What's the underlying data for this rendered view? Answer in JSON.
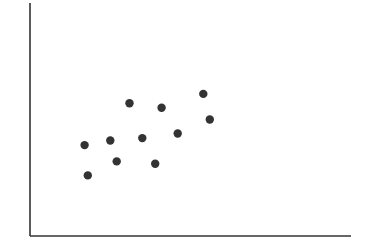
{
  "chart_data": {
    "type": "scatter",
    "title": "",
    "xlabel": "",
    "ylabel": "",
    "xlim": [
      0,
      100
    ],
    "ylim": [
      0,
      100
    ],
    "grid": false,
    "legend": null,
    "x_ticks": [],
    "y_ticks": [],
    "series": [
      {
        "name": "points",
        "color": "#333333",
        "points": [
          {
            "x": 17,
            "y": 39
          },
          {
            "x": 18,
            "y": 26
          },
          {
            "x": 25,
            "y": 41
          },
          {
            "x": 27,
            "y": 32
          },
          {
            "x": 31,
            "y": 57
          },
          {
            "x": 35,
            "y": 42
          },
          {
            "x": 39,
            "y": 31
          },
          {
            "x": 41,
            "y": 55
          },
          {
            "x": 46,
            "y": 44
          },
          {
            "x": 54,
            "y": 61
          },
          {
            "x": 56,
            "y": 50
          }
        ]
      }
    ]
  },
  "style": {
    "axis_color": "#333333",
    "point_color": "#333333",
    "background": "#ffffff"
  },
  "layout": {
    "plot_left": 30,
    "plot_right": 351,
    "plot_top": 3,
    "plot_bottom": 236,
    "point_radius": 4.2
  }
}
